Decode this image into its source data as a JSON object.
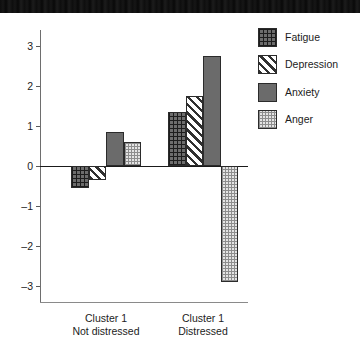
{
  "chart_data": {
    "type": "bar",
    "title": "",
    "subtitle": "",
    "xlabel": "",
    "ylabel": "",
    "ylim": [
      -3.4,
      3.4
    ],
    "yticks": [
      3,
      2,
      1,
      0,
      -1,
      -2,
      -3
    ],
    "ytick_labels": [
      "3",
      "2",
      "1",
      "0",
      "–1",
      "–2",
      "–3"
    ],
    "grid": false,
    "legend_position": "right",
    "categories": [
      "Cluster 1\nNot distressed",
      "Cluster 1\nDistressed"
    ],
    "category_lines": [
      [
        "Cluster 1",
        "Not distressed"
      ],
      [
        "Cluster 1",
        "Distressed"
      ]
    ],
    "series": [
      {
        "name": "Fatigue",
        "pattern": "crosshatch-dark",
        "values": [
          -0.55,
          1.35
        ]
      },
      {
        "name": "Depression",
        "pattern": "diagonal-stripes",
        "values": [
          -0.35,
          1.75
        ]
      },
      {
        "name": "Anxiety",
        "pattern": "solid-gray",
        "values": [
          0.85,
          2.75
        ]
      },
      {
        "name": "Anger",
        "pattern": "fine-checker",
        "values": [
          0.6,
          -2.9
        ]
      }
    ],
    "colors": {
      "fatigue": "#6d6d6d",
      "depression": "#ffffff",
      "anxiety": "#6b6b6b",
      "anger": "#e4e4e4",
      "outline": "#2b2b2b",
      "axis": "#6e6e6e",
      "zero_line": "#1a1a1a",
      "text": "#1c1c1c"
    }
  },
  "legend": {
    "items": [
      {
        "label": "Fatigue"
      },
      {
        "label": "Depression"
      },
      {
        "label": "Anxiety"
      },
      {
        "label": "Anger"
      }
    ]
  }
}
